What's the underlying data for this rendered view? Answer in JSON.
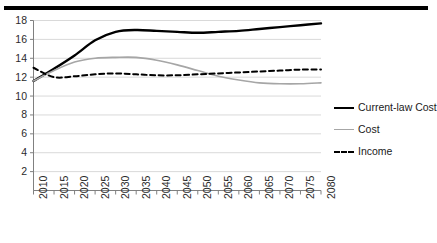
{
  "chart_data": {
    "type": "line",
    "title": "",
    "xlabel": "",
    "ylabel": "",
    "xlim": [
      2010,
      2080
    ],
    "ylim": [
      0,
      18
    ],
    "ytick_step": 2,
    "grid": true,
    "legend_position": "right",
    "x": [
      2010,
      2015,
      2020,
      2025,
      2030,
      2035,
      2040,
      2045,
      2050,
      2055,
      2060,
      2065,
      2070,
      2075,
      2080
    ],
    "xtick_labels": [
      "2010",
      "2015",
      "2020",
      "2025",
      "2030",
      "2035",
      "2040",
      "2045",
      "2050",
      "2055",
      "2060",
      "2065",
      "2070",
      "2075",
      "2080"
    ],
    "ytick_labels": [
      "18",
      "16",
      "14",
      "12",
      "10",
      "8",
      "6",
      "4",
      "2"
    ],
    "ytick_values": [
      18,
      16,
      14,
      12,
      10,
      8,
      6,
      4,
      2
    ],
    "series": [
      {
        "name": "Current-law Cost",
        "style": "solid",
        "color": "#000000",
        "width": 2.4,
        "values": [
          11.6,
          12.9,
          14.3,
          15.9,
          16.8,
          17.0,
          16.9,
          16.8,
          16.7,
          16.8,
          16.9,
          17.1,
          17.3,
          17.5,
          17.7
        ]
      },
      {
        "name": "Cost",
        "style": "solid",
        "color": "#a6a6a6",
        "width": 1.6,
        "values": [
          11.6,
          12.7,
          13.6,
          14.0,
          14.1,
          14.1,
          13.8,
          13.3,
          12.7,
          12.1,
          11.7,
          11.4,
          11.3,
          11.3,
          11.4
        ]
      },
      {
        "name": "Income",
        "style": "dashed",
        "color": "#000000",
        "width": 2.0,
        "values": [
          13.0,
          12.0,
          12.1,
          12.3,
          12.4,
          12.3,
          12.2,
          12.2,
          12.3,
          12.4,
          12.5,
          12.6,
          12.7,
          12.8,
          12.8
        ]
      }
    ]
  },
  "legend": {
    "items": [
      {
        "label": "Current-law Cost",
        "swatch": "solid-bold-black"
      },
      {
        "label": "Cost",
        "swatch": "solid-gray"
      },
      {
        "label": "Income",
        "swatch": "dashed-black"
      }
    ]
  }
}
